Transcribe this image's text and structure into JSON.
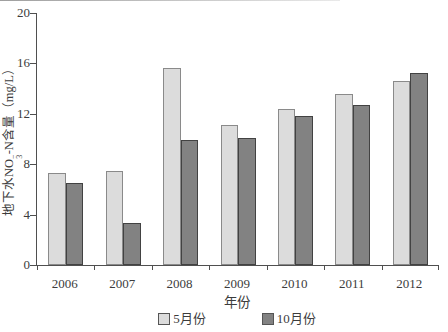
{
  "chart_data": {
    "type": "bar",
    "title": "",
    "categories": [
      "2006",
      "2007",
      "2008",
      "2009",
      "2010",
      "2011",
      "2012"
    ],
    "series": [
      {
        "name": "5月份",
        "values": [
          7.3,
          7.5,
          15.6,
          11.1,
          12.4,
          13.6,
          14.6
        ],
        "color": "#dcdcdc",
        "border_color": "#8a8a8a"
      },
      {
        "name": "10月份",
        "values": [
          6.5,
          3.3,
          9.9,
          10.1,
          11.8,
          12.7,
          15.2
        ],
        "color": "#828282",
        "border_color": "#424242"
      }
    ],
    "xlabel": "年份",
    "ylabel": "地下水NO3−-N含量（mg/L）",
    "ylim": [
      0,
      20
    ],
    "yticks": [
      0,
      4,
      8,
      12,
      16,
      20
    ],
    "grid": false,
    "legend_position": "bottom-center"
  },
  "axis": {
    "xlabel": "年份",
    "ylabel": {
      "pre": "地下水NO",
      "sup": "−",
      "sub": "3",
      "post": "-N含量（mg/L）"
    }
  }
}
